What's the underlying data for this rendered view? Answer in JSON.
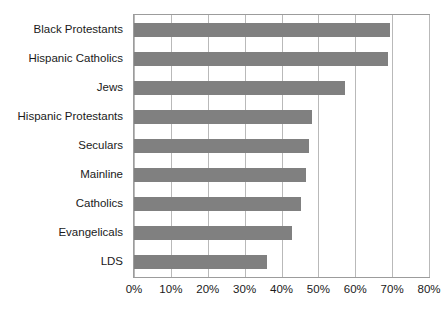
{
  "chart_data": {
    "type": "bar",
    "orientation": "horizontal",
    "title": "",
    "subtitle": "",
    "xlabel": "",
    "ylabel": "",
    "categories": [
      "Black Protestants",
      "Hispanic Catholics",
      "Jews",
      "Hispanic Protestants",
      "Seculars",
      "Mainline",
      "Catholics",
      "Evangelicals",
      "LDS"
    ],
    "values": [
      69.4,
      68.9,
      57.3,
      48.4,
      47.4,
      46.7,
      45.4,
      42.9,
      36.0
    ],
    "value_format": "percent",
    "xlim": [
      0,
      80
    ],
    "ylim": null,
    "xticks": [
      0,
      10,
      20,
      30,
      40,
      50,
      60,
      70,
      80
    ],
    "xtick_labels": [
      "0%",
      "10%",
      "20%",
      "30%",
      "40%",
      "50%",
      "60%",
      "70%",
      "80%"
    ],
    "grid": "vertical",
    "legend": null,
    "legend_position": "none",
    "series": [
      {
        "name": "",
        "values": [
          69.4,
          68.9,
          57.3,
          48.4,
          47.4,
          46.7,
          45.4,
          42.9,
          36.0
        ]
      }
    ],
    "colors": {
      "bar": "#808080",
      "gridline": "#b9b9b9",
      "plot_border": "#9c9c9c",
      "text": "#1a1a1a",
      "background": "#ffffff"
    }
  }
}
